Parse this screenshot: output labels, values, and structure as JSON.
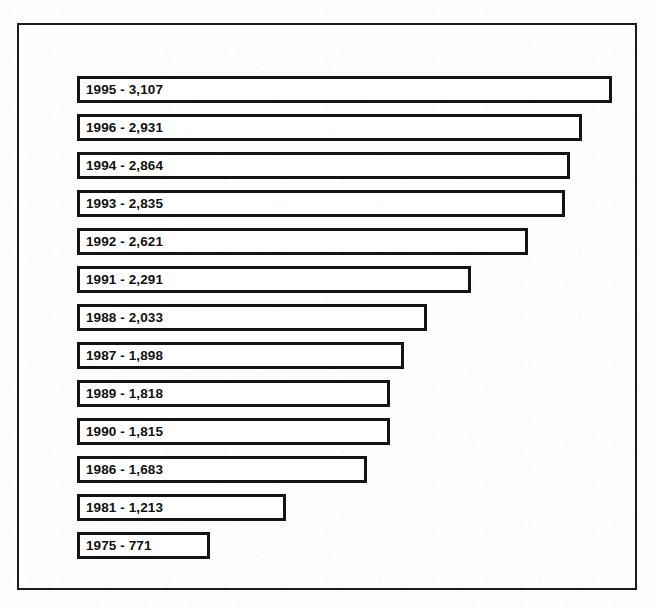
{
  "chart_data": {
    "type": "bar",
    "orientation": "horizontal",
    "title": "",
    "xlabel": "",
    "ylabel": "",
    "grid": false,
    "legend": null,
    "xlim": [
      0,
      3107
    ],
    "axis_visible": false,
    "tick_labels": [],
    "categories": [
      "1995",
      "1996",
      "1994",
      "1993",
      "1992",
      "1991",
      "1988",
      "1987",
      "1989",
      "1990",
      "1986",
      "1981",
      "1975"
    ],
    "values": [
      3107,
      2931,
      2864,
      2835,
      2621,
      2291,
      2033,
      1898,
      1818,
      1815,
      1683,
      1213,
      771
    ],
    "value_labels": [
      "3,107",
      "2,931",
      "2,864",
      "2,835",
      "2,621",
      "2,291",
      "2,033",
      "1,898",
      "1,818",
      "1,815",
      "1,683",
      "1,213",
      "771"
    ],
    "bars": [
      {
        "label": "1995 - 3,107",
        "year": "1995",
        "value": 3107,
        "value_text": "3,107"
      },
      {
        "label": "1996 - 2,931",
        "year": "1996",
        "value": 2931,
        "value_text": "2,931"
      },
      {
        "label": "1994 - 2,864",
        "year": "1994",
        "value": 2864,
        "value_text": "2,864"
      },
      {
        "label": "1993 - 2,835",
        "year": "1993",
        "value": 2835,
        "value_text": "2,835"
      },
      {
        "label": "1992 - 2,621",
        "year": "1992",
        "value": 2621,
        "value_text": "2,621"
      },
      {
        "label": "1991 - 2,291",
        "year": "1991",
        "value": 2291,
        "value_text": "2,291"
      },
      {
        "label": "1988 - 2,033",
        "year": "1988",
        "value": 2033,
        "value_text": "2,033"
      },
      {
        "label": "1987 - 1,898",
        "year": "1987",
        "value": 1898,
        "value_text": "1,898"
      },
      {
        "label": "1989 - 1,818",
        "year": "1989",
        "value": 1818,
        "value_text": "1,818"
      },
      {
        "label": "1990 - 1,815",
        "year": "1990",
        "value": 1815,
        "value_text": "1,815"
      },
      {
        "label": "1986 - 1,683",
        "year": "1986",
        "value": 1683,
        "value_text": "1,683"
      },
      {
        "label": "1981 - 1,213",
        "year": "1981",
        "value": 1213,
        "value_text": "1,213"
      },
      {
        "label": "1975 - 771",
        "year": "1975",
        "value": 771,
        "value_text": "771"
      }
    ]
  },
  "style": {
    "bar_fill": "#ffffff",
    "bar_border": "#141414",
    "frame_border": "#1c1c1c",
    "text_color": "#111111",
    "background": "#fdfdfd"
  },
  "layout": {
    "bar_height_px": 27,
    "bar_pitch_px": 38,
    "bars_left_px": 58,
    "bars_top_px": 51,
    "px_per_unit": 0.1722
  }
}
